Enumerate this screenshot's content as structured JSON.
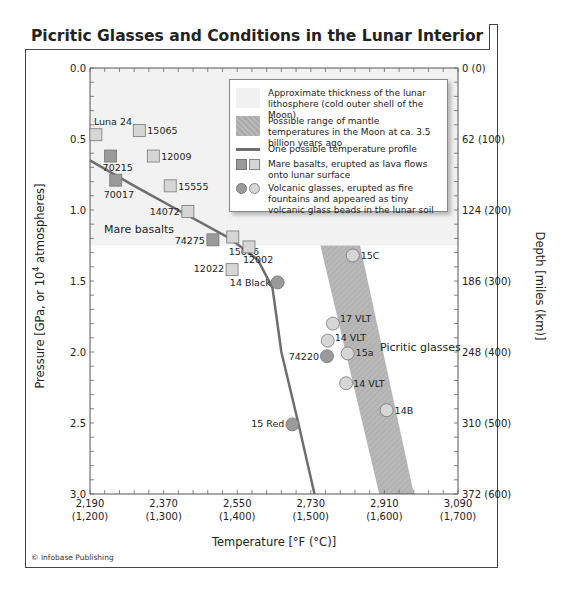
{
  "title": "Picritic Glasses and Conditions in the Lunar Interior",
  "credit": "© Infobase Publishing",
  "chart_data": {
    "type": "scatter",
    "title": "Picritic Glasses and Conditions in the Lunar Interior",
    "xlabel": "Temperature [°F (°C)]",
    "ylabel_left": "Pressure [GPa, or 10^4 atmospheres]",
    "ylabel_right": "Depth [miles (km)]",
    "xlim_c": [
      1200,
      1700
    ],
    "ylim_gpa": [
      3.0,
      0.0
    ],
    "x_ticks": [
      {
        "f": "2,190",
        "c": "(1,200)"
      },
      {
        "f": "2,370",
        "c": "(1,300)"
      },
      {
        "f": "2,550",
        "c": "(1,400)"
      },
      {
        "f": "2,730",
        "c": "(1,500)"
      },
      {
        "f": "2,910",
        "c": "(1,600)"
      },
      {
        "f": "3,090",
        "c": "(1,700)"
      }
    ],
    "y_ticks_left": [
      "0.0",
      "0.5",
      "1.0",
      "1.5",
      "2.0",
      "2.5",
      "3.0"
    ],
    "y_ticks_right": [
      "0 (0)",
      "62 (100)",
      "124 (200)",
      "186 (300)",
      "248 (400)",
      "310 (500)",
      "372 (600)"
    ],
    "lithosphere_base_gpa": 1.25,
    "mantle_band": {
      "top_gpa": 1.25,
      "bottom_gpa": 3.0,
      "top_left_c": 1513,
      "top_right_c": 1567,
      "bottom_left_c": 1593,
      "bottom_right_c": 1640
    },
    "temperature_profile": [
      [
        1200,
        0.65
      ],
      [
        1260,
        0.83
      ],
      [
        1330,
        1.03
      ],
      [
        1390,
        1.2
      ],
      [
        1428,
        1.35
      ],
      [
        1448,
        1.55
      ],
      [
        1460,
        2.0
      ],
      [
        1483,
        2.5
      ],
      [
        1505,
        3.0
      ]
    ],
    "mare_basalts": [
      {
        "label": "Luna 24",
        "c": 1208,
        "gpa": 0.47,
        "shade": "light"
      },
      {
        "label": "15065",
        "c": 1267,
        "gpa": 0.44,
        "shade": "light"
      },
      {
        "label": "70215",
        "c": 1228,
        "gpa": 0.62,
        "shade": "dark"
      },
      {
        "label": "12009",
        "c": 1286,
        "gpa": 0.62,
        "shade": "light"
      },
      {
        "label": "70017",
        "c": 1235,
        "gpa": 0.79,
        "shade": "dark"
      },
      {
        "label": "15555",
        "c": 1309,
        "gpa": 0.83,
        "shade": "light"
      },
      {
        "label": "14072",
        "c": 1333,
        "gpa": 1.01,
        "shade": "light"
      },
      {
        "label": "74275",
        "c": 1367,
        "gpa": 1.21,
        "shade": "dark"
      },
      {
        "label": "15016",
        "c": 1394,
        "gpa": 1.19,
        "shade": "light"
      },
      {
        "label": "12002",
        "c": 1416,
        "gpa": 1.26,
        "shade": "light"
      },
      {
        "label": "12022",
        "c": 1393,
        "gpa": 1.42,
        "shade": "light"
      }
    ],
    "picritic_glasses": [
      {
        "label": "14 Black",
        "c": 1455,
        "gpa": 1.51,
        "shade": "dark"
      },
      {
        "label": "15C",
        "c": 1557,
        "gpa": 1.32,
        "shade": "light"
      },
      {
        "label": "17 VLT",
        "c": 1530,
        "gpa": 1.8,
        "shade": "light"
      },
      {
        "label": "14 VLT",
        "c": 1523,
        "gpa": 1.92,
        "shade": "light"
      },
      {
        "label": "74220",
        "c": 1522,
        "gpa": 2.03,
        "shade": "dark"
      },
      {
        "label": "15a",
        "c": 1550,
        "gpa": 2.01,
        "shade": "light"
      },
      {
        "label": "14 VLT",
        "c": 1548,
        "gpa": 2.22,
        "shade": "light"
      },
      {
        "label": "14B",
        "c": 1603,
        "gpa": 2.41,
        "shade": "light"
      },
      {
        "label": "15 Red",
        "c": 1475,
        "gpa": 2.51,
        "shade": "dark"
      }
    ],
    "annotations": [
      "Mare basalts",
      "Picritic glasses"
    ],
    "legend": [
      "Approximate thickness of the lunar lithosphere (cold outer shell of the Moon)",
      "Possible range of mantle temperatures in the Moon at ca. 3.5 billion years ago",
      "One possible temperature profile",
      "Mare basalts, erupted as lava flows onto lunar surface",
      "Volcanic glasses, erupted as fire fountains and appeared as tiny volcanic glass beads in the lunar soil"
    ],
    "colors": {
      "lithosphere": "#f2f2f2",
      "band": "#b4b4b4",
      "profile": "#6e6e6e",
      "dark_marker": "#9a9a9a",
      "light_marker": "#d6d6d6"
    }
  },
  "labels": {
    "mare_basalts": "Mare basalts",
    "picritic_glasses": "Picritic glasses",
    "xlabel": "Temperature [°F (°C)]",
    "ylabel_left_pre": "Pressure [GPa, or 10",
    "ylabel_left_sup": "4",
    "ylabel_left_post": " atmospheres]",
    "ylabel_right": "Depth [miles (km)]"
  }
}
